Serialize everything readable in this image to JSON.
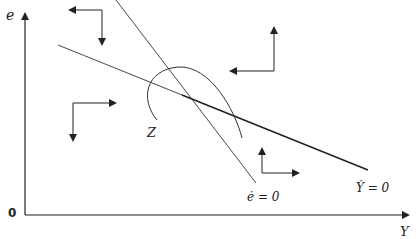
{
  "diagram": {
    "axes": {
      "y_label": "e",
      "x_label": "Y",
      "origin_label": "0"
    },
    "curves": {
      "e_dot_locus": "ė = 0",
      "y_dot_locus": "Ẏ = 0",
      "trajectory": "Z"
    },
    "direction_arrows": [
      {
        "region": "upper-left",
        "horizontal": "left",
        "vertical": "down"
      },
      {
        "region": "lower-left",
        "horizontal": "right",
        "vertical": "down"
      },
      {
        "region": "upper-right",
        "horizontal": "left",
        "vertical": "up"
      },
      {
        "region": "lower-right",
        "horizontal": "right",
        "vertical": "up"
      }
    ],
    "colors": {
      "ink": "#222222",
      "background": "#ffffff"
    }
  }
}
